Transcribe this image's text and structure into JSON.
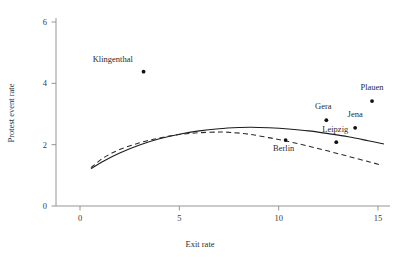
{
  "chart_data": {
    "type": "scatter",
    "title": "",
    "xlabel": "Exit rate",
    "ylabel": "Protest event rate",
    "xlim": [
      -0.3,
      15.8
    ],
    "ylim": [
      0,
      6.6
    ],
    "xticks": [
      0,
      5,
      10,
      15
    ],
    "yticks": [
      0,
      2,
      4,
      6
    ],
    "xtick_labels": [
      "0",
      "5",
      "10",
      "15"
    ],
    "ytick_labels": [
      "0",
      "2",
      "4",
      "6"
    ],
    "grid": false,
    "legend": "none",
    "points": [
      {
        "label": "Klingenthal",
        "x": 3.2,
        "y": 4.38,
        "label_dx": -1.55,
        "label_dy": 0.33,
        "anchor": "middle"
      },
      {
        "label": "Berlin",
        "x": 10.35,
        "y": 2.15,
        "label_dx": -0.1,
        "label_dy": -0.37,
        "anchor": "middle"
      },
      {
        "label": "Leipzig",
        "x": 12.9,
        "y": 2.08,
        "label_dx": -0.05,
        "label_dy": 0.33,
        "anchor": "middle"
      },
      {
        "label": "Gera",
        "x": 12.4,
        "y": 2.8,
        "label_dx": -0.15,
        "label_dy": 0.36,
        "anchor": "middle"
      },
      {
        "label": "Jena",
        "x": 13.85,
        "y": 2.55,
        "label_dx": 0.0,
        "label_dy": 0.36,
        "anchor": "middle"
      },
      {
        "label": "Plauen",
        "x": 14.7,
        "y": 3.42,
        "label_dx": 0.0,
        "label_dy": 0.36,
        "anchor": "middle"
      }
    ],
    "series": [
      {
        "name": "fitted-curve-solid",
        "style": "solid",
        "x": [
          0.55,
          1.2,
          2.0,
          3.0,
          4.0,
          5.0,
          6.0,
          7.0,
          8.0,
          8.6,
          9.5,
          10.5,
          11.5,
          12.5,
          13.5,
          14.5,
          15.3
        ],
        "y": [
          1.22,
          1.47,
          1.73,
          1.99,
          2.19,
          2.34,
          2.45,
          2.52,
          2.56,
          2.57,
          2.55,
          2.51,
          2.45,
          2.36,
          2.26,
          2.13,
          2.02
        ]
      },
      {
        "name": "fitted-curve-dashed",
        "style": "dashed",
        "x": [
          0.55,
          1.2,
          2.0,
          3.0,
          4.0,
          5.0,
          6.0,
          7.0,
          7.6,
          8.5,
          9.5,
          10.5,
          11.5,
          12.5,
          13.5,
          14.5,
          15.2
        ],
        "y": [
          1.25,
          1.58,
          1.84,
          2.06,
          2.22,
          2.33,
          2.39,
          2.41,
          2.4,
          2.34,
          2.23,
          2.1,
          1.95,
          1.79,
          1.62,
          1.45,
          1.33
        ]
      }
    ]
  }
}
